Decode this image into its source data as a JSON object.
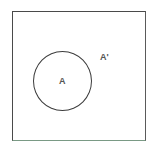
{
  "diagram": {
    "type": "venn",
    "title": "",
    "universal_set": {
      "name": "universal-set-rectangle",
      "label": "",
      "border_color": "#4a4a4a",
      "bottom_border_color": "#7a9a85",
      "fill_color": "#ffffff"
    },
    "regions": [
      {
        "id": "set-a",
        "label": "A",
        "shape": "circle",
        "border_color": "#3c3c3c",
        "fill_color": "transparent",
        "description": "set A inside universal set"
      },
      {
        "id": "complement-a",
        "label": "A'",
        "shape": "region",
        "fill_color": "transparent",
        "description": "complement of A, region of universal set outside circle A"
      }
    ],
    "label_color": "#555555",
    "background_color": "#ffffff"
  }
}
